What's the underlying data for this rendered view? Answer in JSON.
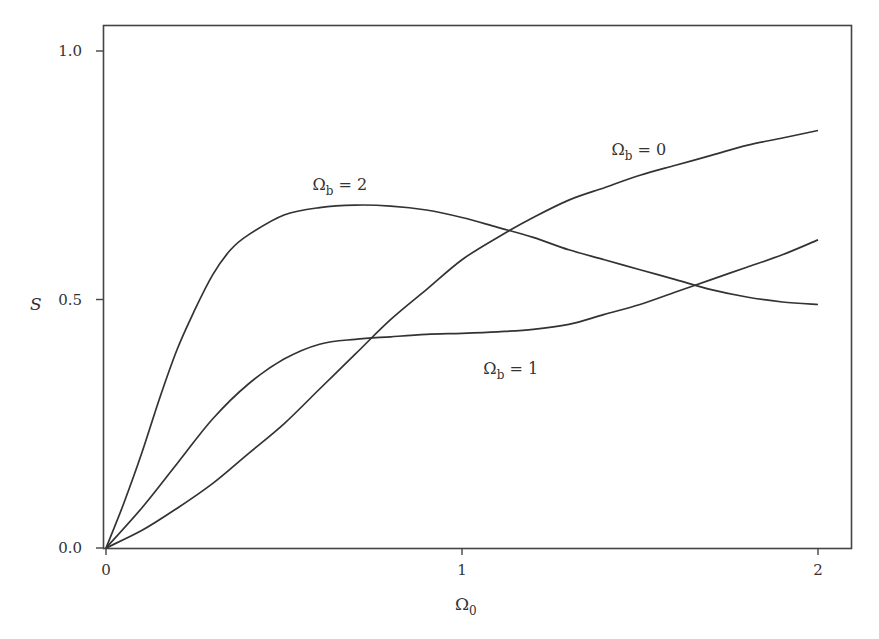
{
  "chart_data": {
    "type": "line",
    "title": "",
    "xlabel": "Ω0",
    "xlabel_main": "Ω",
    "xlabel_sub": "0",
    "ylabel": "S",
    "xlim": [
      0,
      2.1
    ],
    "ylim": [
      0,
      1.05
    ],
    "grid": false,
    "legend": "inline labels",
    "x_ticks": [
      {
        "value": 0,
        "label": "0"
      },
      {
        "value": 1,
        "label": "1"
      },
      {
        "value": 2,
        "label": "2"
      }
    ],
    "y_ticks": [
      {
        "value": 0.0,
        "label": "0.0"
      },
      {
        "value": 0.5,
        "label": "0.5"
      },
      {
        "value": 1.0,
        "label": "1.0"
      }
    ],
    "series": [
      {
        "name": "Ωb = 2",
        "label_main": "Ω",
        "label_sub": "b",
        "label_rest": " = 2",
        "label_pos": [
          0.58,
          0.72
        ],
        "x": [
          0,
          0.05,
          0.1,
          0.15,
          0.2,
          0.25,
          0.3,
          0.35,
          0.4,
          0.5,
          0.6,
          0.7,
          0.8,
          0.9,
          1.0,
          1.1,
          1.2,
          1.3,
          1.4,
          1.5,
          1.6,
          1.7,
          1.8,
          1.9,
          2.0
        ],
        "values": [
          0,
          0.09,
          0.19,
          0.3,
          0.4,
          0.48,
          0.55,
          0.6,
          0.63,
          0.67,
          0.685,
          0.69,
          0.688,
          0.68,
          0.665,
          0.645,
          0.625,
          0.6,
          0.58,
          0.56,
          0.54,
          0.52,
          0.505,
          0.495,
          0.49
        ]
      },
      {
        "name": "Ωb = 1",
        "label_main": "Ω",
        "label_sub": "b",
        "label_rest": " = 1",
        "label_pos": [
          1.06,
          0.35
        ],
        "x": [
          0,
          0.1,
          0.2,
          0.3,
          0.4,
          0.5,
          0.6,
          0.7,
          0.8,
          0.9,
          1.0,
          1.1,
          1.2,
          1.3,
          1.4,
          1.5,
          1.6,
          1.7,
          1.8,
          1.9,
          2.0
        ],
        "values": [
          0,
          0.08,
          0.17,
          0.26,
          0.33,
          0.38,
          0.41,
          0.42,
          0.425,
          0.43,
          0.432,
          0.435,
          0.44,
          0.45,
          0.47,
          0.49,
          0.515,
          0.54,
          0.565,
          0.59,
          0.62
        ]
      },
      {
        "name": "Ωb = 0",
        "label_main": "Ω",
        "label_sub": "b",
        "label_rest": " = 0",
        "label_pos": [
          1.42,
          0.79
        ],
        "x": [
          0,
          0.1,
          0.2,
          0.3,
          0.4,
          0.5,
          0.6,
          0.7,
          0.8,
          0.9,
          1.0,
          1.1,
          1.2,
          1.3,
          1.4,
          1.5,
          1.6,
          1.7,
          1.8,
          1.9,
          2.0
        ],
        "values": [
          0,
          0.035,
          0.08,
          0.13,
          0.19,
          0.25,
          0.32,
          0.39,
          0.46,
          0.52,
          0.58,
          0.625,
          0.665,
          0.7,
          0.725,
          0.75,
          0.77,
          0.79,
          0.81,
          0.825,
          0.84
        ]
      }
    ]
  }
}
